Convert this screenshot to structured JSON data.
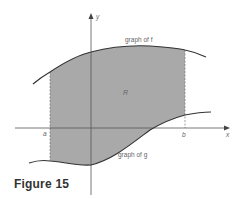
{
  "figure": {
    "caption": "Figure 15",
    "region_label": "R",
    "f_label": "graph of f",
    "g_label": "graph of g",
    "x_axis_label": "x",
    "y_axis_label": "y",
    "a_label": "a",
    "b_label": "b"
  },
  "colors": {
    "region_fill": "#a8a8a8",
    "curve": "#333333",
    "axis": "#555555",
    "label": "#666666"
  }
}
